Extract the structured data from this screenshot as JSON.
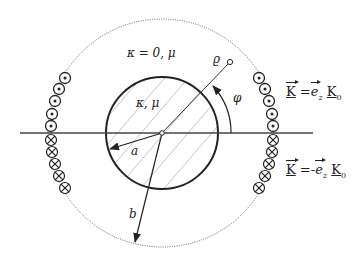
{
  "diagram": {
    "outer_region_label": "κ = 0, μ",
    "inner_region_label": "κ, μ",
    "radius_inner_label": "a",
    "radius_outer_label": "b",
    "point_label": "ϱ",
    "angle_label": "φ",
    "upper_current": {
      "vector": "K",
      "eq": "=",
      "sign": "",
      "unit": "e",
      "unit_sub": "z",
      "magnitude": "K",
      "magnitude_sub": "0"
    },
    "lower_current": {
      "vector": "K",
      "eq": "=",
      "sign": "-",
      "unit": "e",
      "unit_sub": "z",
      "magnitude": "K",
      "magnitude_sub": "0"
    },
    "colors": {
      "stroke": "#222222",
      "hatch": "#b5b5b5",
      "dotted": "#555555"
    }
  }
}
